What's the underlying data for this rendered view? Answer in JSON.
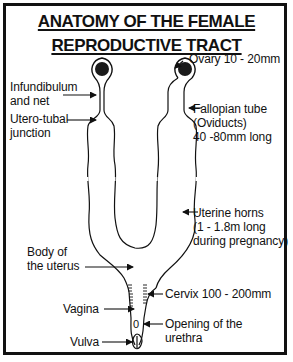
{
  "title": {
    "line1": "ANATOMY OF THE FEMALE",
    "line2": "REPRODUCTIVE TRACT"
  },
  "labels": {
    "ovary": "Ovary 10 - 20mm",
    "infundibulum_line1": "Infundibulum",
    "infundibulum_line2": "and net",
    "utero_tubal_line1": "Utero-tubal",
    "utero_tubal_line2": "junction",
    "fallopian_line1": "Fallopian tube",
    "fallopian_line2": "(Oviducts)",
    "fallopian_line3": "40 -80mm long",
    "uterine_horns_line1": "Uterine horns",
    "uterine_horns_line2": "(1 - 1.8m long",
    "uterine_horns_line3": "during pregnancy)",
    "body_uterus_line1": "Body of",
    "body_uterus_line2": "the uterus",
    "cervix": "Cervix 100 - 200mm",
    "vagina": "Vagina",
    "urethra_line1": "Opening of the",
    "urethra_line2": "urethra",
    "vulva": "Vulva",
    "urethra_marker": "0"
  },
  "colors": {
    "ink": "#111111",
    "background": "#ffffff",
    "ovary_fill": "#1a1a1a"
  }
}
